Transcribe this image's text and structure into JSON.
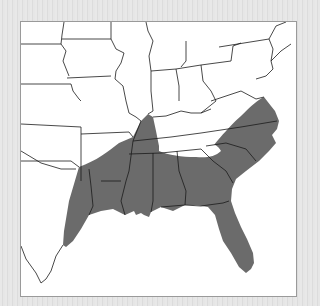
{
  "map": {
    "title": "",
    "region": "Southeastern United States",
    "range_fill_color": "#6b6b6b",
    "background_color": "#ffffff",
    "frame_color": "#9a9a9a",
    "legend": []
  }
}
